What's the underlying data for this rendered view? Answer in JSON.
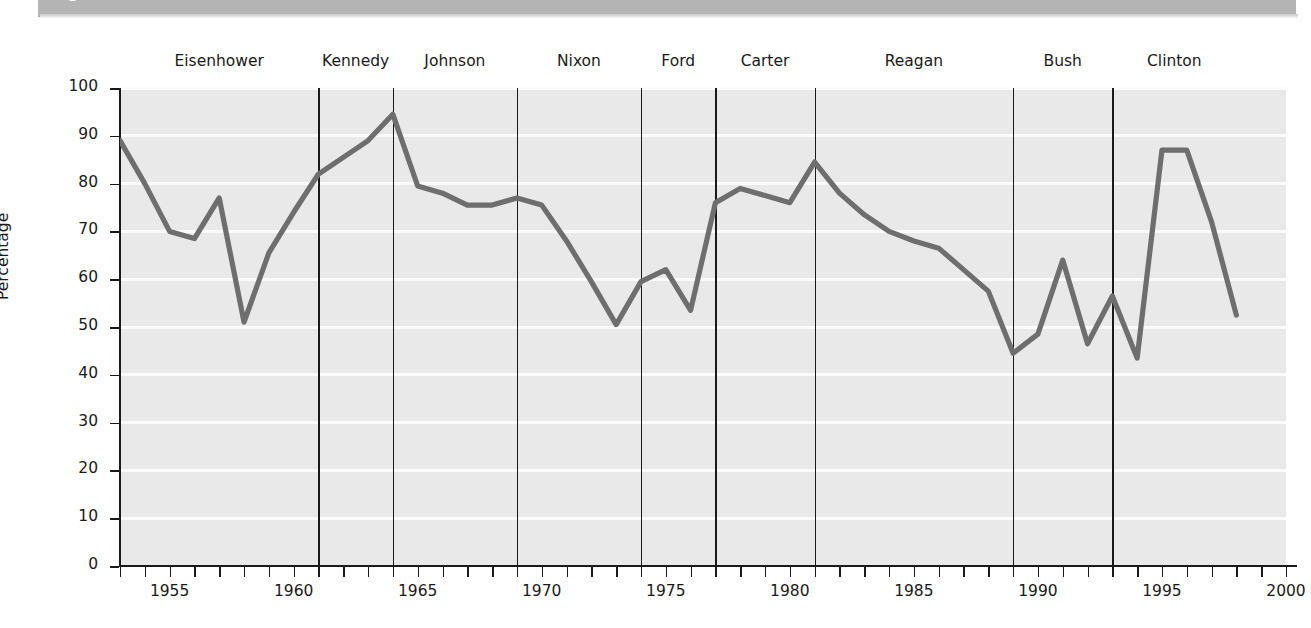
{
  "header": {
    "figure_label": "Figure 12.1"
  },
  "chart_data": {
    "type": "line",
    "title": "",
    "xlabel": "",
    "ylabel": "Percentage",
    "xlim": [
      1953,
      2000
    ],
    "ylim": [
      0,
      100
    ],
    "grid": true,
    "legend": "none",
    "y_ticks": [
      0,
      10,
      20,
      30,
      40,
      50,
      60,
      70,
      80,
      90,
      100
    ],
    "y_tick_labels": [
      "0",
      "10",
      "20",
      "30",
      "40",
      "50",
      "60",
      "70",
      "80",
      "90",
      "100"
    ],
    "x_ticks": [
      1953,
      1954,
      1955,
      1956,
      1957,
      1958,
      1959,
      1960,
      1961,
      1962,
      1963,
      1964,
      1965,
      1966,
      1967,
      1968,
      1969,
      1970,
      1971,
      1972,
      1973,
      1974,
      1975,
      1976,
      1977,
      1978,
      1979,
      1980,
      1981,
      1982,
      1983,
      1984,
      1985,
      1986,
      1987,
      1988,
      1989,
      1990,
      1991,
      1992,
      1993,
      1994,
      1995,
      1996,
      1997,
      1998,
      1999,
      2000
    ],
    "x_tick_labels": [
      {
        "x": 1955,
        "label": "1955"
      },
      {
        "x": 1960,
        "label": "1960"
      },
      {
        "x": 1965,
        "label": "1965"
      },
      {
        "x": 1970,
        "label": "1970"
      },
      {
        "x": 1975,
        "label": "1975"
      },
      {
        "x": 1980,
        "label": "1980"
      },
      {
        "x": 1985,
        "label": "1985"
      },
      {
        "x": 1990,
        "label": "1990"
      },
      {
        "x": 1995,
        "label": "1995"
      },
      {
        "x": 2000,
        "label": "2000"
      }
    ],
    "series": [
      {
        "name": "Percentage",
        "color": "#6e6e6e",
        "x": [
          1953,
          1954,
          1955,
          1956,
          1957,
          1958,
          1959,
          1960,
          1961,
          1962,
          1963,
          1964,
          1965,
          1966,
          1967,
          1968,
          1969,
          1970,
          1971,
          1972,
          1973,
          1974,
          1975,
          1976,
          1977,
          1978,
          1979,
          1980,
          1981,
          1982,
          1983,
          1984,
          1985,
          1986,
          1987,
          1988,
          1989,
          1990,
          1991,
          1992,
          1993,
          1994,
          1995,
          1996,
          1997,
          1998
        ],
        "values": [
          89,
          80,
          70,
          68.5,
          77,
          51,
          65.5,
          74,
          82,
          85.5,
          89,
          94.5,
          79.5,
          78,
          75.5,
          75.5,
          77,
          75.5,
          68,
          59.5,
          50.5,
          59.5,
          62,
          53.5,
          76,
          79,
          77.5,
          76,
          84.5,
          78,
          73.5,
          70,
          68,
          66.5,
          62,
          57.5,
          44.5,
          48.5,
          64,
          46.5,
          56.5,
          43.5,
          87,
          87,
          72,
          52.5
        ]
      }
    ],
    "annotations": {
      "presidents": [
        {
          "name": "Eisenhower",
          "label_x": 1961,
          "start": 1953,
          "end": 1961
        },
        {
          "name": "Kennedy",
          "label_x": 1964,
          "start": 1961,
          "end": 1964
        },
        {
          "name": "Johnson",
          "label_x": 1969,
          "start": 1964,
          "end": 1969
        },
        {
          "name": "Nixon",
          "label_x": 1974,
          "start": 1969,
          "end": 1974
        },
        {
          "name": "Ford",
          "label_x": 1977,
          "start": 1974,
          "end": 1977
        },
        {
          "name": "Carter",
          "label_x": 1981,
          "start": 1977,
          "end": 1981
        },
        {
          "name": "Reagan",
          "label_x": 1989,
          "start": 1981,
          "end": 1989
        },
        {
          "name": "Bush",
          "label_x": 1993,
          "start": 1989,
          "end": 1993
        },
        {
          "name": "Clinton",
          "label_x": 1998,
          "start": 1993,
          "end": 1998
        }
      ],
      "divider_years": [
        1961,
        1964,
        1969,
        1974,
        1977,
        1981,
        1989,
        1993
      ]
    },
    "colors": {
      "line": "#6e6e6e",
      "plot_background": "#e9e9e9",
      "gridline": "#fbfbfb",
      "axis": "#1a1a1a",
      "header_band": "#b4b4b4"
    }
  }
}
